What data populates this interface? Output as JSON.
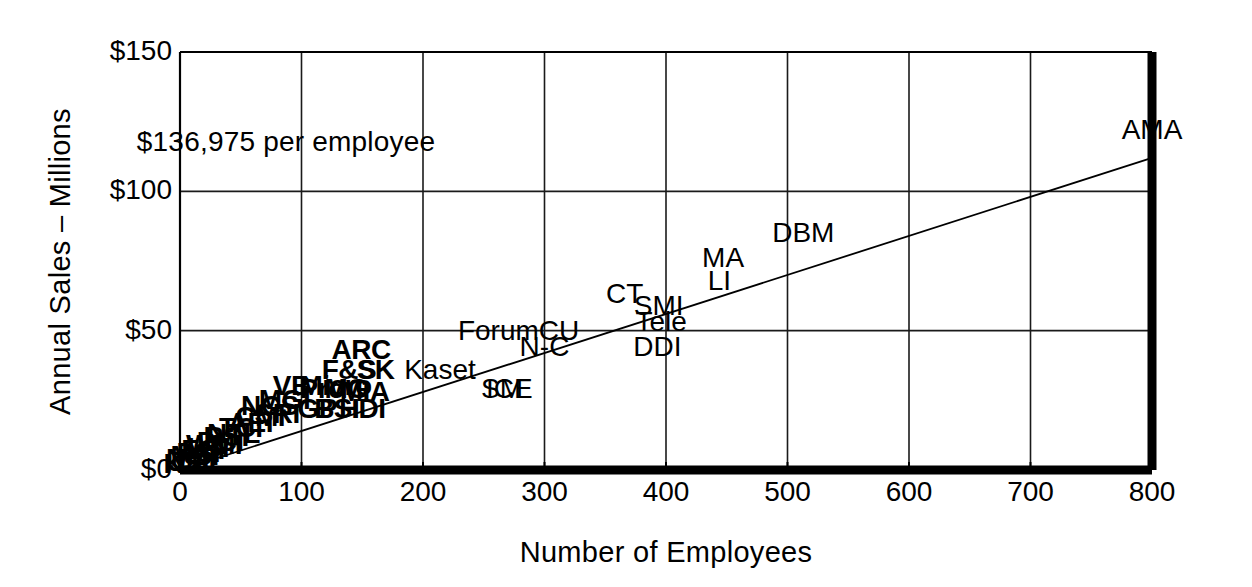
{
  "chart_data": {
    "type": "scatter",
    "title": "",
    "xlabel": "Number of Employees",
    "ylabel": "Annual Sales – Millions",
    "xlim": [
      0,
      800
    ],
    "ylim": [
      0,
      150
    ],
    "xticks": [
      0,
      100,
      200,
      300,
      400,
      500,
      600,
      700,
      800
    ],
    "xticklabels": [
      "0",
      "100",
      "200",
      "300",
      "400",
      "500",
      "600",
      "700",
      "800"
    ],
    "yticks": [
      0,
      50,
      100,
      150
    ],
    "yticklabels": [
      "$0",
      "$50",
      "$100",
      "$150"
    ],
    "grid": true,
    "legend": "none",
    "annotation": "$136,975 per employee",
    "annotation_x": 55,
    "annotation_y": 118,
    "trendline": {
      "label": "regression line",
      "x": [
        0,
        800
      ],
      "y": [
        0,
        112
      ]
    },
    "point_label_style": "text-markers",
    "points": [
      {
        "label": "AMA",
        "x": 800,
        "y": 122
      },
      {
        "label": "DBM",
        "x": 513,
        "y": 85
      },
      {
        "label": "MA",
        "x": 447,
        "y": 76
      },
      {
        "label": "LI",
        "x": 444,
        "y": 68
      },
      {
        "label": "CT",
        "x": 366,
        "y": 63
      },
      {
        "label": "SMI",
        "x": 394,
        "y": 59
      },
      {
        "label": "Tele",
        "x": 396,
        "y": 53
      },
      {
        "label": "DDI",
        "x": 393,
        "y": 44
      },
      {
        "label": "CU",
        "x": 312,
        "y": 50
      },
      {
        "label": "N-C",
        "x": 300,
        "y": 44
      },
      {
        "label": "Forum",
        "x": 262,
        "y": 50
      },
      {
        "label": "Kaset",
        "x": 214,
        "y": 36
      },
      {
        "label": "SM",
        "x": 265,
        "y": 29
      },
      {
        "label": "ICE",
        "x": 271,
        "y": 29
      },
      {
        "label": "ARC",
        "x": 149,
        "y": 43
      },
      {
        "label": "F&S",
        "x": 139,
        "y": 36
      },
      {
        "label": "SK",
        "x": 161,
        "y": 36
      },
      {
        "label": "Pro",
        "x": 117,
        "y": 29
      },
      {
        "label": "MIA",
        "x": 152,
        "y": 28
      },
      {
        "label": "MG",
        "x": 137,
        "y": 29
      },
      {
        "label": "Micro",
        "x": 128,
        "y": 30
      },
      {
        "label": "HDI",
        "x": 150,
        "y": 22
      },
      {
        "label": "BSI",
        "x": 129,
        "y": 22
      },
      {
        "label": "GP",
        "x": 113,
        "y": 22
      },
      {
        "label": "VB",
        "x": 92,
        "y": 30
      },
      {
        "label": "MGI",
        "x": 86,
        "y": 25
      },
      {
        "label": "NCS",
        "x": 74,
        "y": 23
      },
      {
        "label": "SRI",
        "x": 80,
        "y": 20
      },
      {
        "label": "CMI",
        "x": 66,
        "y": 19
      },
      {
        "label": "AEI",
        "x": 58,
        "y": 17
      },
      {
        "label": "TCI",
        "x": 50,
        "y": 15
      },
      {
        "label": "NTL",
        "x": 44,
        "y": 13
      },
      {
        "label": "RSI",
        "x": 38,
        "y": 12
      },
      {
        "label": "DCI",
        "x": 33,
        "y": 10
      },
      {
        "label": "WMI",
        "x": 28,
        "y": 9
      },
      {
        "label": "LSI",
        "x": 23,
        "y": 8
      },
      {
        "label": "ESI",
        "x": 19,
        "y": 7
      },
      {
        "label": "PSI",
        "x": 15,
        "y": 6
      },
      {
        "label": "MSI",
        "x": 12,
        "y": 5
      },
      {
        "label": "NMI",
        "x": 9,
        "y": 4
      },
      {
        "label": "JSI",
        "x": 7,
        "y": 3
      },
      {
        "label": "KSI",
        "x": 5,
        "y": 2
      }
    ]
  },
  "axes": {
    "x_title": "Number of Employees",
    "y_title": "Annual Sales – Millions"
  },
  "colors": {
    "ink": "#000000",
    "background": "#ffffff",
    "grid": "#1a1a1a"
  }
}
